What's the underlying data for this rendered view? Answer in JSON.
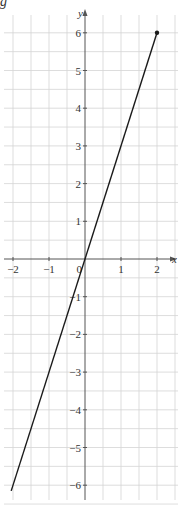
{
  "fragment_text": "g",
  "chart_data": {
    "type": "line",
    "title": "",
    "xlabel": "x",
    "ylabel": "y",
    "xlim": [
      -2.2,
      2.5
    ],
    "ylim": [
      -6.5,
      6.3
    ],
    "x_ticks": [
      -2,
      -1,
      0,
      1,
      2
    ],
    "y_ticks": [
      -6,
      -5,
      -4,
      -3,
      -2,
      -1,
      1,
      2,
      3,
      4,
      5,
      6
    ],
    "origin_label": "0",
    "grid": true,
    "grid_step": 0.5,
    "series": [
      {
        "name": "y = 3x",
        "x": [
          -2.05,
          2
        ],
        "y": [
          -6.15,
          6
        ],
        "endpoint_marker": [
          2,
          6
        ]
      }
    ]
  },
  "colors": {
    "grid": "#d4d4d4",
    "axis": "#555555",
    "line": "#1a1a1a"
  }
}
